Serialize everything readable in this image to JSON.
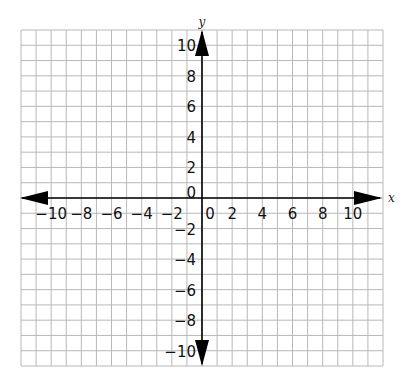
{
  "chart_data": {
    "type": "scatter",
    "title": "",
    "xlabel": "x",
    "ylabel": "y",
    "xlim": [
      -12,
      12
    ],
    "ylim": [
      -11,
      11
    ],
    "xticks": [
      -10,
      -8,
      -6,
      -4,
      -2,
      0,
      2,
      4,
      6,
      8,
      10
    ],
    "yticks": [
      10,
      8,
      6,
      4,
      2,
      0,
      -2,
      -4,
      -6,
      -8,
      -10
    ],
    "xtick_labels": [
      "−10",
      "−8",
      "−6",
      "−4",
      "−2",
      "0",
      "2",
      "4",
      "6",
      "8",
      "10"
    ],
    "ytick_labels": [
      "10",
      "8",
      "6",
      "4",
      "2",
      "0",
      "−2",
      "−4",
      "−6",
      "−8",
      "−10"
    ],
    "grid": true,
    "grid_step": 1,
    "points": [],
    "legend": null
  },
  "colors": {
    "grid": "#b8b8b8",
    "axis": "#000000",
    "background": "#ffffff"
  }
}
